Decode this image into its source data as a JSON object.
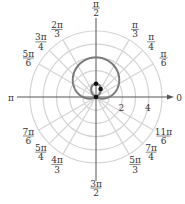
{
  "chart_data": {
    "type": "polar",
    "title": "",
    "curve": {
      "equation": "r = 1 + 2 sin(theta)",
      "kind": "limacon with inner loop",
      "color": "#7a7a7a"
    },
    "radial_ticks": [
      2,
      4
    ],
    "radial_grid": [
      1,
      2,
      3,
      4,
      5
    ],
    "angular_grid_deg": [
      0,
      30,
      45,
      60,
      90,
      120,
      135,
      150,
      180,
      210,
      225,
      240,
      270,
      300,
      315,
      330
    ],
    "angle_labels": [
      {
        "deg": 0,
        "num": "0",
        "den": ""
      },
      {
        "deg": 30,
        "num": "π",
        "den": "6"
      },
      {
        "deg": 45,
        "num": "π",
        "den": "4"
      },
      {
        "deg": 60,
        "num": "π",
        "den": "3"
      },
      {
        "deg": 90,
        "num": "π",
        "den": "2"
      },
      {
        "deg": 120,
        "num": "2π",
        "den": "3"
      },
      {
        "deg": 135,
        "num": "3π",
        "den": "4"
      },
      {
        "deg": 150,
        "num": "5π",
        "den": "6"
      },
      {
        "deg": 180,
        "num": "π",
        "den": ""
      },
      {
        "deg": 210,
        "num": "7π",
        "den": "6"
      },
      {
        "deg": 225,
        "num": "5π",
        "den": "4"
      },
      {
        "deg": 240,
        "num": "4π",
        "den": "3"
      },
      {
        "deg": 270,
        "num": "3π",
        "den": "2"
      },
      {
        "deg": 300,
        "num": "5π",
        "den": "3"
      },
      {
        "deg": 315,
        "num": "7π",
        "den": "4"
      },
      {
        "deg": 330,
        "num": "11π",
        "den": "6"
      }
    ],
    "points": [
      {
        "r": 0,
        "theta_deg": 0
      },
      {
        "r": 1,
        "theta_deg": 90
      },
      {
        "r": 0.7,
        "theta_deg": 60
      }
    ],
    "grid_color": "#d4d4d4",
    "axis_color": "#555555"
  }
}
